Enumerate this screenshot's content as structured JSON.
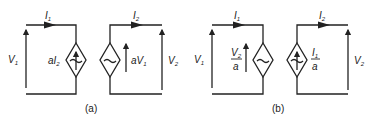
{
  "figure": {
    "panels": [
      {
        "caption": "(a)",
        "left_loop": {
          "current_label": "I",
          "current_sub": "1",
          "voltage_label": "V",
          "voltage_sub": "1",
          "source_type": "dependent current source",
          "source_label_a": "aI",
          "source_label_sub": "2"
        },
        "right_loop": {
          "current_label": "I",
          "current_sub": "2",
          "voltage_label": "V",
          "voltage_sub": "2",
          "source_type": "dependent voltage source",
          "source_label_a": "aV",
          "source_label_sub": "1"
        }
      },
      {
        "caption": "(b)",
        "left_loop": {
          "current_label": "I",
          "current_sub": "1",
          "voltage_label": "V",
          "voltage_sub": "1",
          "source_type": "dependent voltage source",
          "source_num": "V",
          "source_num_sub": "2",
          "source_den": "a"
        },
        "right_loop": {
          "current_label": "I",
          "current_sub": "2",
          "voltage_label": "V",
          "voltage_sub": "2",
          "source_type": "dependent current source",
          "source_num": "I",
          "source_num_sub": "1",
          "source_den": "a"
        }
      }
    ]
  }
}
